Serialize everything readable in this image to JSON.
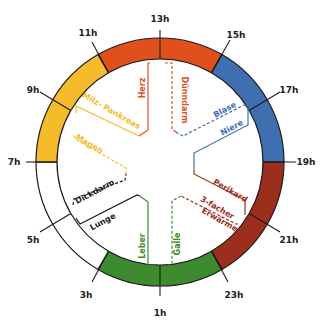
{
  "center": {
    "x": 160,
    "y": 162
  },
  "ring": {
    "outer_r": 124,
    "inner_r": 103
  },
  "colors": {
    "herz_duenndarm": "#e0501c",
    "blase_niere": "#3f6fb0",
    "perikard_3e": "#9c2f1c",
    "leber_galle": "#3e8a2e",
    "lunge_dickdarm": "#ffffff",
    "magen_milz": "#f5bb2a",
    "outline": "#1a1a1a"
  },
  "hours": [
    {
      "label": "13h"
    },
    {
      "label": "15h"
    },
    {
      "label": "17h"
    },
    {
      "label": "19h"
    },
    {
      "label": "21h"
    },
    {
      "label": "23h"
    },
    {
      "label": "1h"
    },
    {
      "label": "3h"
    },
    {
      "label": "5h"
    },
    {
      "label": "7h"
    },
    {
      "label": "9h"
    },
    {
      "label": "11h"
    }
  ],
  "organs": {
    "herz": "Herz",
    "duenndarm": "Dünndarm",
    "blase": "Blase",
    "niere": "Niere",
    "perikard": "Perikard",
    "dreifach_1": "3-facher",
    "dreifach_2": "Erwärmer",
    "galle": "Galle",
    "leber": "Leber",
    "lunge": "Lunge",
    "dickdarm": "Dickdarm",
    "magen": "Magen",
    "milz": "Milz- Pankreas"
  }
}
